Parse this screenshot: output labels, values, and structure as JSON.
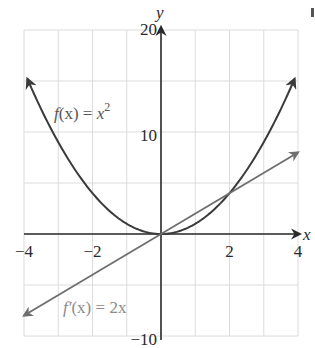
{
  "chart_data": {
    "type": "line",
    "title": "",
    "xlabel": "x",
    "ylabel": "y",
    "xlim": [
      -4,
      4
    ],
    "ylim": [
      -10,
      20
    ],
    "grid": true,
    "x_grid_step": 1,
    "y_grid_step": 5,
    "x_ticks": [
      {
        "value": -4,
        "label": "−4"
      },
      {
        "value": -2,
        "label": "−2"
      },
      {
        "value": 2,
        "label": "2"
      },
      {
        "value": 4,
        "label": "4"
      }
    ],
    "y_ticks": [
      {
        "value": 20,
        "label": "20"
      },
      {
        "value": 10,
        "label": "10"
      },
      {
        "value": -10,
        "label": "−10"
      }
    ],
    "series": [
      {
        "name": "f(x) = x^2",
        "label_parts": {
          "f": "f",
          "args": "(x)",
          "eq": " = ",
          "rhs": "x",
          "sup": "2"
        },
        "expression": "x^2",
        "x_range": [
          -3.9,
          3.9
        ],
        "points": [
          [
            -3.9,
            15.21
          ],
          [
            -3,
            9
          ],
          [
            -2,
            4
          ],
          [
            -1,
            1
          ],
          [
            0,
            0
          ],
          [
            1,
            1
          ],
          [
            2,
            4
          ],
          [
            3,
            9
          ],
          [
            3.9,
            15.21
          ]
        ],
        "color": "#3a3a3a",
        "arrows": "both"
      },
      {
        "name": "f'(x) = 2x",
        "label_parts": {
          "f": "f′",
          "args": "(x)",
          "eq": " = ",
          "rhs": "2x"
        },
        "expression": "2x",
        "x_range": [
          -4,
          4
        ],
        "points": [
          [
            -4,
            -8
          ],
          [
            -2,
            -4
          ],
          [
            0,
            0
          ],
          [
            2,
            4
          ],
          [
            4,
            8
          ]
        ],
        "color": "#6e6e6e",
        "arrows": "both"
      }
    ],
    "annotations": [
      {
        "text": "f(x) = x²",
        "near": [
          -2.5,
          11
        ]
      },
      {
        "text": "f′(x) = 2x",
        "near": [
          -1.5,
          -7.8
        ]
      }
    ],
    "intersections": [
      [
        0,
        0
      ],
      [
        2,
        4
      ]
    ],
    "legend": "none (inline labels)"
  },
  "colors": {
    "grid": "#dcdcdc",
    "axis": "#2a2a2a",
    "parabola": "#3a3a3a",
    "derivative": "#6e6e6e",
    "derivative_label": "#8a8a8a",
    "parabola_label": "#555555"
  }
}
